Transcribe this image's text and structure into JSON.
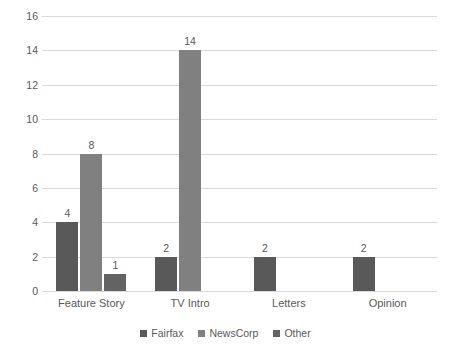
{
  "chart_data": {
    "type": "bar",
    "title": "",
    "subtitle": "",
    "xlabel": "",
    "ylabel": "",
    "categories": [
      "Feature Story",
      "TV Intro",
      "Letters",
      "Opinion"
    ],
    "series": [
      {
        "name": "Fairfax",
        "color": "#595959",
        "values": [
          4,
          2,
          2,
          2
        ]
      },
      {
        "name": "NewsCorp",
        "color": "#808080",
        "values": [
          8,
          14,
          0,
          0
        ]
      },
      {
        "name": "Other",
        "color": "#636363",
        "values": [
          1,
          0,
          0,
          0
        ]
      }
    ],
    "ylim": [
      0,
      16
    ],
    "ytick_step": 2,
    "yticks": [
      "0",
      "2",
      "4",
      "6",
      "8",
      "10",
      "12",
      "14",
      "16"
    ],
    "data_labels": {
      "Feature Story": {
        "Fairfax": "4",
        "NewsCorp": "8",
        "Other": "1"
      },
      "TV Intro": {
        "Fairfax": "2",
        "NewsCorp": "14"
      },
      "Letters": {
        "Fairfax": "2"
      },
      "Opinion": {
        "Fairfax": "2"
      }
    },
    "grid": true,
    "grid_axis": "y",
    "grid_color": "#d9d9d9",
    "legend_position": "bottom",
    "background_color": "#ffffff",
    "text_color": "#595959"
  },
  "legend": {
    "items": [
      {
        "label": "Fairfax"
      },
      {
        "label": "NewsCorp"
      },
      {
        "label": "Other"
      }
    ]
  }
}
